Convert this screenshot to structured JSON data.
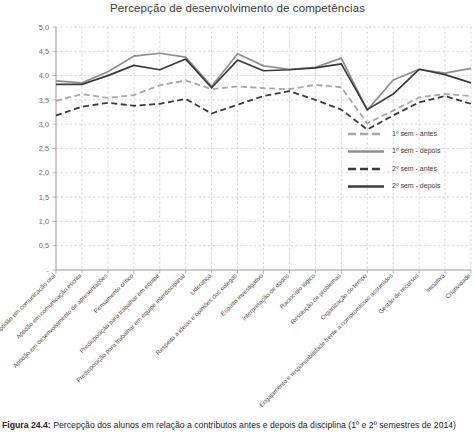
{
  "figure": {
    "caption_label": "Figura 24.4:",
    "caption_text": "Percepção dos alunos em relação a contributos antes e depois da disciplina (1º e 2º semestres de 2014)"
  },
  "chart_data": {
    "type": "line",
    "title": "Percepção de desenvolvimento de competências",
    "xlabel": "",
    "ylabel": "",
    "ylim": [
      0,
      5
    ],
    "ytick_labels": [
      "-",
      "0,5",
      "1,0",
      "1,5",
      "2,0",
      "2,5",
      "3,0",
      "3,5",
      "4,0",
      "4,5",
      "5,0"
    ],
    "ytick_values": [
      0,
      0.5,
      1.0,
      1.5,
      2.0,
      2.5,
      3.0,
      3.5,
      4.0,
      4.5,
      5.0
    ],
    "grid": true,
    "grid_style": "dashed",
    "legend_position": "inside-right",
    "categories": [
      "Aptidão em comunicação oral",
      "Aptidão em comunicação escrita",
      "Aptidão em desenvolvimento de apresentações",
      "Pensamento crítico",
      "Predisposição para trabalhar em equipe",
      "Predisposição para trabalhar em equipe interdisciplinar",
      "Liderança",
      "Respeito a ideias e opiniões dos colegas",
      "Espírito investigativo",
      "Interpretação de dados",
      "Raciocínio lógico",
      "Resolução de problemas",
      "Organização do tempo",
      "Engajamento e responsabilidade frente a compromissos assumidos",
      "Gestão de recursos",
      "Iniciativa",
      "Criatividade"
    ],
    "series": [
      {
        "name": "1º sem - antes",
        "color": "#a8a8a8",
        "style": "dashed",
        "values": [
          3.48,
          3.62,
          3.54,
          3.6,
          3.8,
          3.9,
          3.72,
          3.78,
          3.74,
          3.72,
          3.81,
          3.76,
          3.02,
          3.28,
          3.55,
          3.62,
          3.58
        ]
      },
      {
        "name": "1º sem - depois",
        "color": "#8f8f8f",
        "style": "solid",
        "values": [
          3.89,
          3.85,
          4.08,
          4.4,
          4.46,
          4.38,
          3.78,
          4.45,
          4.2,
          4.13,
          4.17,
          4.36,
          3.29,
          3.91,
          4.13,
          4.05,
          4.15
        ]
      },
      {
        "name": "2º sem - antes",
        "color": "#3a3a3a",
        "style": "dashed",
        "values": [
          3.18,
          3.36,
          3.44,
          3.38,
          3.42,
          3.52,
          3.22,
          3.4,
          3.58,
          3.68,
          3.5,
          3.3,
          2.89,
          3.18,
          3.45,
          3.58,
          3.42
        ]
      },
      {
        "name": "2º sem - depois",
        "color": "#3a3a3a",
        "style": "solid",
        "values": [
          3.82,
          3.82,
          4.0,
          4.21,
          4.12,
          4.34,
          3.75,
          4.32,
          4.1,
          4.12,
          4.16,
          4.24,
          3.3,
          3.62,
          4.13,
          4.02,
          3.85
        ]
      }
    ]
  }
}
